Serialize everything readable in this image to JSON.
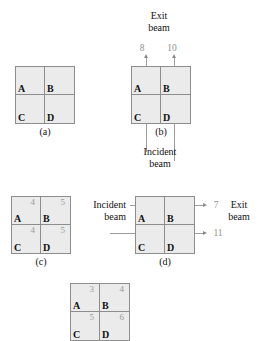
{
  "figure": {
    "panels": [
      {
        "id": "a",
        "label": "(a)",
        "cells": [
          {
            "letter": "A",
            "value": ""
          },
          {
            "letter": "B",
            "value": ""
          },
          {
            "letter": "C",
            "value": ""
          },
          {
            "letter": "D",
            "value": ""
          }
        ]
      },
      {
        "id": "b",
        "label": "(b)",
        "cells": [
          {
            "letter": "A",
            "value": ""
          },
          {
            "letter": "B",
            "value": ""
          },
          {
            "letter": "C",
            "value": ""
          },
          {
            "letter": "D",
            "value": ""
          }
        ],
        "exit_beam_label": "Exit\nbeam",
        "exit_beam_line1": "Exit",
        "exit_beam_line2": "beam",
        "incident_beam_line1": "Incident",
        "incident_beam_line2": "beam",
        "exit_values": [
          "8",
          "10"
        ]
      },
      {
        "id": "c",
        "label": "(c)",
        "cells": [
          {
            "letter": "A",
            "value": "4"
          },
          {
            "letter": "B",
            "value": "5"
          },
          {
            "letter": "C",
            "value": "4"
          },
          {
            "letter": "D",
            "value": "5"
          }
        ]
      },
      {
        "id": "d",
        "label": "(d)",
        "cells": [
          {
            "letter": "A",
            "value": ""
          },
          {
            "letter": "B",
            "value": ""
          },
          {
            "letter": "C",
            "value": ""
          },
          {
            "letter": "D",
            "value": ""
          }
        ],
        "incident_beam_line1": "Incident",
        "incident_beam_line2": "beam",
        "exit_beam_line1": "Exit",
        "exit_beam_line2": "beam",
        "exit_values": [
          "7",
          "11"
        ]
      },
      {
        "id": "e",
        "label": "",
        "cells": [
          {
            "letter": "A",
            "value": "3"
          },
          {
            "letter": "B",
            "value": "4"
          },
          {
            "letter": "C",
            "value": "5"
          },
          {
            "letter": "D",
            "value": "6"
          }
        ]
      }
    ],
    "colors": {
      "cell_fill": "#ebebeb",
      "cell_border": "#8d8d8d",
      "beam_line": "#9d9d9d",
      "value_text": "#9a9a9a",
      "label_text": "#111111"
    }
  }
}
